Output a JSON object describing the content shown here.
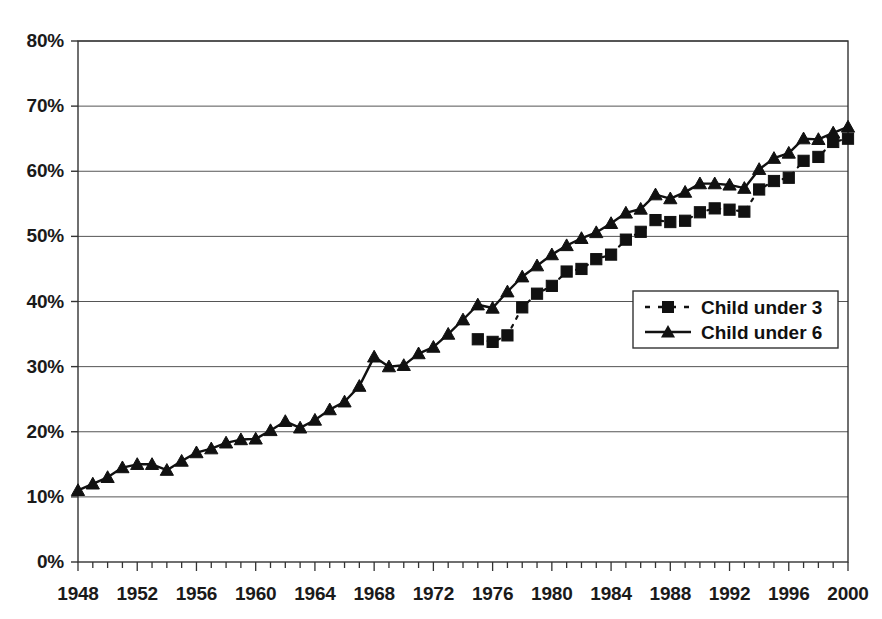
{
  "chart_data": {
    "type": "line",
    "title": "",
    "subtitle": "",
    "xlabel": "",
    "ylabel": "",
    "xlim": [
      1948,
      2000
    ],
    "ylim": [
      0,
      80
    ],
    "ytick_labels": [
      "0%",
      "10%",
      "20%",
      "30%",
      "40%",
      "50%",
      "60%",
      "70%",
      "80%"
    ],
    "ytick_values": [
      0,
      10,
      20,
      30,
      40,
      50,
      60,
      70,
      80
    ],
    "xtick_labels": [
      "1948",
      "1952",
      "1956",
      "1960",
      "1964",
      "1968",
      "1972",
      "1976",
      "1980",
      "1984",
      "1988",
      "1992",
      "1996",
      "2000"
    ],
    "xtick_values": [
      1948,
      1952,
      1956,
      1960,
      1964,
      1968,
      1972,
      1976,
      1980,
      1984,
      1988,
      1992,
      1996,
      2000
    ],
    "minor_xtick_interval": 1,
    "grid": "horizontal",
    "legend_position": "center-right",
    "series": [
      {
        "name": "Child under 3",
        "marker": "square",
        "line_style": "dashed",
        "color": "#111111",
        "x": [
          1975,
          1976,
          1977,
          1978,
          1979,
          1980,
          1981,
          1982,
          1983,
          1984,
          1985,
          1986,
          1987,
          1988,
          1989,
          1990,
          1991,
          1992,
          1993,
          1994,
          1995,
          1996,
          1997,
          1998,
          1999,
          2000
        ],
        "values": [
          34.2,
          33.8,
          34.8,
          39.1,
          41.2,
          42.4,
          44.6,
          45.0,
          46.5,
          47.2,
          49.5,
          50.7,
          52.5,
          52.2,
          52.4,
          53.7,
          54.3,
          54.1,
          53.8,
          57.2,
          58.5,
          59.0,
          61.6,
          62.2,
          64.5,
          65.0
        ]
      },
      {
        "name": "Child under 6",
        "marker": "triangle",
        "line_style": "solid",
        "color": "#111111",
        "x": [
          1948,
          1949,
          1950,
          1951,
          1952,
          1953,
          1954,
          1955,
          1956,
          1957,
          1958,
          1959,
          1960,
          1961,
          1962,
          1963,
          1964,
          1965,
          1966,
          1967,
          1968,
          1969,
          1970,
          1971,
          1972,
          1973,
          1974,
          1975,
          1976,
          1977,
          1978,
          1979,
          1980,
          1981,
          1982,
          1983,
          1984,
          1985,
          1986,
          1987,
          1988,
          1989,
          1990,
          1991,
          1992,
          1993,
          1994,
          1995,
          1996,
          1997,
          1998,
          1999,
          2000
        ],
        "values": [
          11.0,
          12.0,
          13.0,
          14.5,
          15.0,
          15.0,
          14.1,
          15.5,
          16.8,
          17.4,
          18.3,
          18.8,
          18.9,
          20.2,
          21.6,
          20.6,
          21.8,
          23.4,
          24.6,
          27.0,
          31.5,
          30.0,
          30.2,
          32.0,
          33.0,
          35.0,
          37.2,
          39.5,
          39.0,
          41.5,
          43.8,
          45.5,
          47.2,
          48.6,
          49.7,
          50.6,
          52.0,
          53.6,
          54.2,
          56.4,
          55.8,
          56.8,
          58.1,
          58.1,
          57.9,
          57.4,
          60.3,
          62.0,
          62.8,
          65.0,
          64.9,
          65.9,
          66.8
        ]
      }
    ]
  },
  "legend": {
    "entries": [
      {
        "label": "Child under 3"
      },
      {
        "label": "Child under 6"
      }
    ]
  }
}
